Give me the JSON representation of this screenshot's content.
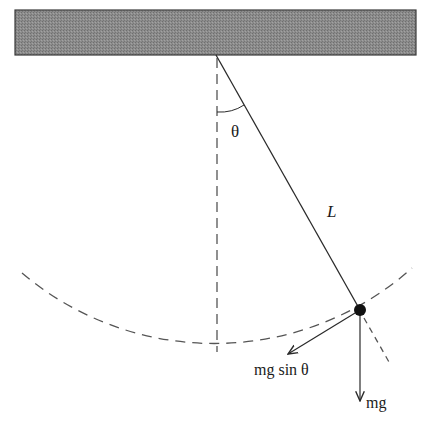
{
  "diagram": {
    "type": "simple-pendulum-free-body",
    "labels": {
      "angle": "θ",
      "length": "L",
      "tangential_force": "mg sin θ",
      "weight": "mg"
    },
    "geometry": {
      "ceiling": {
        "x": 15,
        "y": 10,
        "width": 401,
        "height": 45
      },
      "pivot": {
        "x": 216,
        "y": 55
      },
      "bob": {
        "x": 360,
        "y": 310,
        "r": 6
      },
      "arc_radius": 297
    },
    "colors": {
      "ceiling_fill": "#8a8a8a",
      "ceiling_stroke": "#3a3a3a",
      "line": "#2a2a2a",
      "dashed": "#555555",
      "bob": "#111111",
      "background": "#ffffff"
    }
  }
}
